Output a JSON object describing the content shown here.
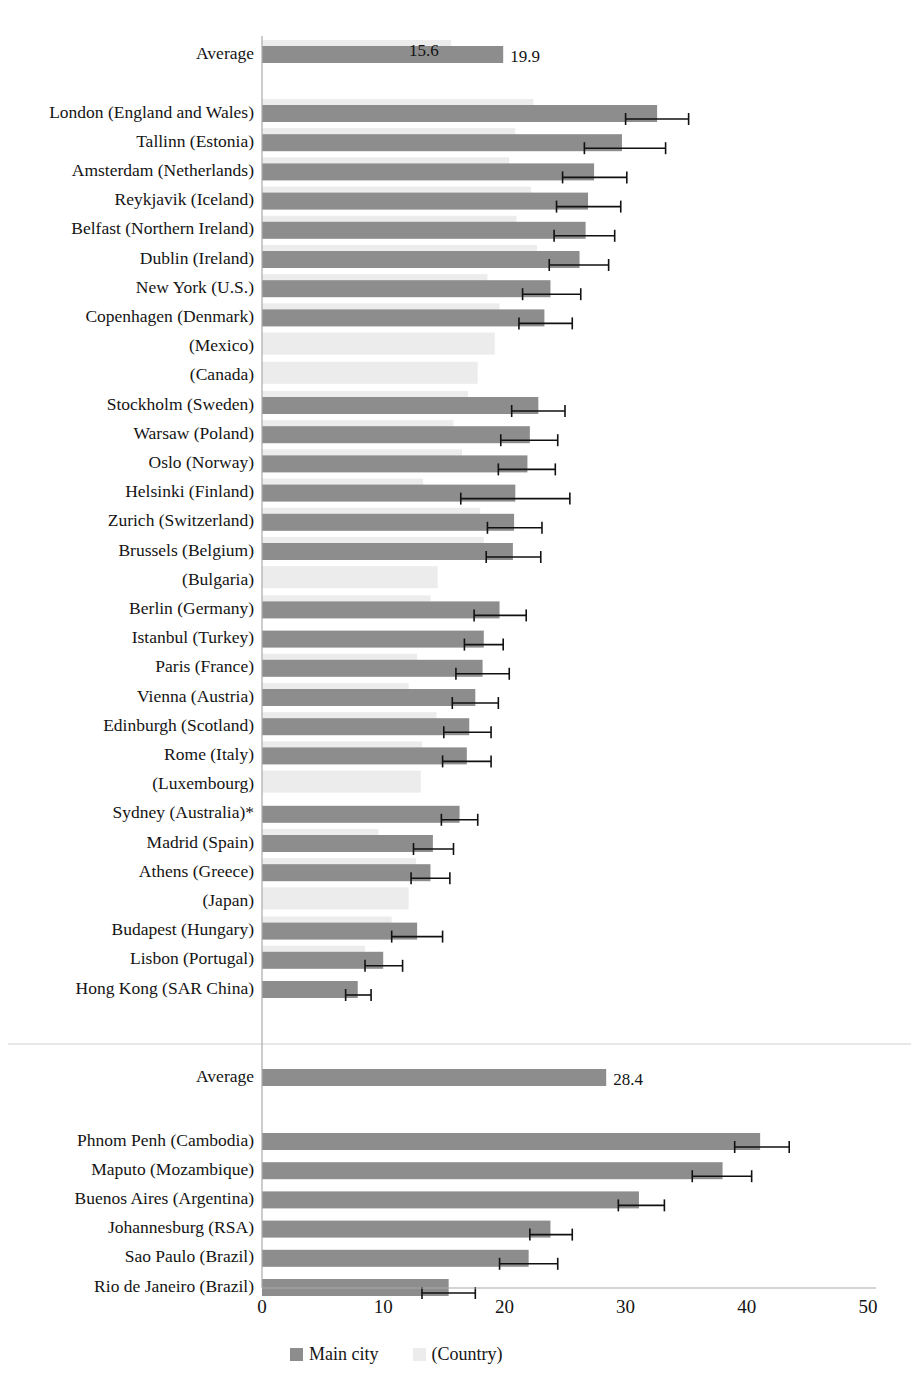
{
  "chart_data": {
    "type": "bar",
    "orientation": "horizontal",
    "title": "",
    "xlabel": "",
    "ylabel": "",
    "xlim": [
      0,
      50
    ],
    "xticks": [
      0,
      10,
      20,
      30,
      40,
      50
    ],
    "xtick_labels": [
      "0",
      "10",
      "20",
      "30",
      "40",
      "50"
    ],
    "grid": false,
    "legend_position": "bottom-center",
    "series": [
      {
        "name": "Main city",
        "key": "city",
        "color": "#8d8d8d"
      },
      {
        "name": "(Country)",
        "key": "country",
        "color": "#ececec"
      }
    ],
    "panels": [
      {
        "id": "panel-upper",
        "average": {
          "label": "Average",
          "country": 15.6,
          "city": 19.9,
          "country_label": "15.6",
          "city_label": "19.9"
        },
        "rows": [
          {
            "label": "London (England and Wales)",
            "country": 22.4,
            "city": 32.6,
            "ci_low": 30.0,
            "ci_high": 35.2
          },
          {
            "label": "Tallinn (Estonia)",
            "country": 20.9,
            "city": 29.7,
            "ci_low": 26.6,
            "ci_high": 33.3
          },
          {
            "label": "Amsterdam (Netherlands)",
            "country": 20.4,
            "city": 27.4,
            "ci_low": 24.8,
            "ci_high": 30.1
          },
          {
            "label": "Reykjavik (Iceland)",
            "country": 22.2,
            "city": 26.9,
            "ci_low": 24.3,
            "ci_high": 29.6
          },
          {
            "label": "Belfast (Northern Ireland)",
            "country": 21.0,
            "city": 26.7,
            "ci_low": 24.1,
            "ci_high": 29.1
          },
          {
            "label": "Dublin (Ireland)",
            "country": 22.7,
            "city": 26.2,
            "ci_low": 23.7,
            "ci_high": 28.6
          },
          {
            "label": "New York (U.S.)",
            "country": 18.6,
            "city": 23.8,
            "ci_low": 21.5,
            "ci_high": 26.3
          },
          {
            "label": "Copenhagen (Denmark)",
            "country": 19.6,
            "city": 23.3,
            "ci_low": 21.2,
            "ci_high": 25.6
          },
          {
            "label": "(Mexico)",
            "country": 19.2,
            "city": null,
            "ci_low": null,
            "ci_high": null
          },
          {
            "label": "(Canada)",
            "country": 17.8,
            "city": null,
            "ci_low": null,
            "ci_high": null
          },
          {
            "label": "Stockholm (Sweden)",
            "country": 17.0,
            "city": 22.8,
            "ci_low": 20.6,
            "ci_high": 25.0
          },
          {
            "label": "Warsaw (Poland)",
            "country": 15.8,
            "city": 22.1,
            "ci_low": 19.7,
            "ci_high": 24.4
          },
          {
            "label": "Oslo (Norway)",
            "country": 16.5,
            "city": 21.9,
            "ci_low": 19.5,
            "ci_high": 24.2
          },
          {
            "label": "Helsinki (Finland)",
            "country": 13.3,
            "city": 20.9,
            "ci_low": 16.4,
            "ci_high": 25.4
          },
          {
            "label": "Zurich (Switzerland)",
            "country": 18.0,
            "city": 20.8,
            "ci_low": 18.6,
            "ci_high": 23.1
          },
          {
            "label": "Brussels (Belgium)",
            "country": 18.3,
            "city": 20.7,
            "ci_low": 18.5,
            "ci_high": 23.0
          },
          {
            "label": "(Bulgaria)",
            "country": 14.5,
            "city": null,
            "ci_low": null,
            "ci_high": null
          },
          {
            "label": "Berlin (Germany)",
            "country": 13.9,
            "city": 19.6,
            "ci_low": 17.5,
            "ci_high": 21.8
          },
          {
            "label": "Istanbul (Turkey)",
            "country": null,
            "city": 18.3,
            "ci_low": 16.7,
            "ci_high": 19.9
          },
          {
            "label": "Paris (France)",
            "country": 12.8,
            "city": 18.2,
            "ci_low": 16.0,
            "ci_high": 20.4
          },
          {
            "label": "Vienna (Austria)",
            "country": 12.1,
            "city": 17.6,
            "ci_low": 15.7,
            "ci_high": 19.5
          },
          {
            "label": "Edinburgh (Scotland)",
            "country": 14.4,
            "city": 17.1,
            "ci_low": 15.0,
            "ci_high": 18.9
          },
          {
            "label": "Rome (Italy)",
            "country": 13.2,
            "city": 16.9,
            "ci_low": 14.9,
            "ci_high": 18.9
          },
          {
            "label": "(Luxembourg)",
            "country": 13.1,
            "city": null,
            "ci_low": null,
            "ci_high": null
          },
          {
            "label": "Sydney (Australia)*",
            "country": null,
            "city": 16.3,
            "ci_low": 14.8,
            "ci_high": 17.8
          },
          {
            "label": "Madrid (Spain)",
            "country": 9.6,
            "city": 14.1,
            "ci_low": 12.5,
            "ci_high": 15.8
          },
          {
            "label": "Athens (Greece)",
            "country": 12.7,
            "city": 13.9,
            "ci_low": 12.3,
            "ci_high": 15.5
          },
          {
            "label": "(Japan)",
            "country": 12.1,
            "city": null,
            "ci_low": null,
            "ci_high": null
          },
          {
            "label": "Budapest (Hungary)",
            "country": 10.7,
            "city": 12.8,
            "ci_low": 10.7,
            "ci_high": 14.9
          },
          {
            "label": "Lisbon (Portugal)",
            "country": 8.5,
            "city": 10.0,
            "ci_low": 8.5,
            "ci_high": 11.6
          },
          {
            "label": "Hong Kong (SAR China)",
            "country": null,
            "city": 7.9,
            "ci_low": 6.9,
            "ci_high": 9.0
          }
        ]
      },
      {
        "id": "panel-lower",
        "average": {
          "label": "Average",
          "country": null,
          "city": 28.4,
          "country_label": "",
          "city_label": "28.4"
        },
        "rows": [
          {
            "label": "Phnom Penh (Cambodia)",
            "country": null,
            "city": 41.1,
            "ci_low": 39.0,
            "ci_high": 43.5
          },
          {
            "label": "Maputo (Mozambique)",
            "country": null,
            "city": 38.0,
            "ci_low": 35.5,
            "ci_high": 40.4
          },
          {
            "label": "Buenos Aires (Argentina)",
            "country": null,
            "city": 31.1,
            "ci_low": 29.4,
            "ci_high": 33.2
          },
          {
            "label": "Johannesburg (RSA)",
            "country": null,
            "city": 23.8,
            "ci_low": 22.1,
            "ci_high": 25.6
          },
          {
            "label": "Sao Paulo (Brazil)",
            "country": null,
            "city": 22.0,
            "ci_low": 19.6,
            "ci_high": 24.4
          },
          {
            "label": "Rio de Janeiro (Brazil)",
            "country": null,
            "city": 15.4,
            "ci_low": 13.2,
            "ci_high": 17.6
          }
        ]
      }
    ],
    "legend": [
      {
        "label": "Main city",
        "color": "#8d8d8d"
      },
      {
        "label": "(Country)",
        "color": "#ececec"
      }
    ],
    "colors": {
      "city": "#8d8d8d",
      "country": "#ececec",
      "axis": "#aaaaaa",
      "error_bar": "#111111",
      "text": "#141414"
    }
  }
}
